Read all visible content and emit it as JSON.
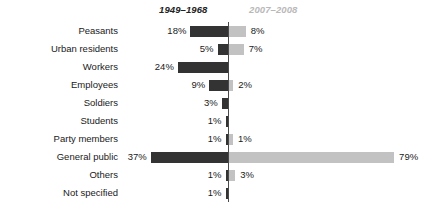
{
  "chart_data": {
    "type": "bar",
    "subtype": "diverging-horizontal-bar",
    "title": "",
    "subtitle": "",
    "xlabel": "",
    "ylabel": "",
    "grid": false,
    "legend_position": "top",
    "axis_zero_label": "0%",
    "value_suffix": "%",
    "xlim": [
      0,
      79
    ],
    "categories": [
      "Peasants",
      "Urban residents",
      "Workers",
      "Employees",
      "Soldiers",
      "Students",
      "Party members",
      "General public",
      "Others",
      "Not specified"
    ],
    "series": [
      {
        "name": "1949–1968",
        "side": "left",
        "color": "#333333",
        "values": [
          18,
          5,
          24,
          9,
          3,
          1,
          1,
          37,
          1,
          1
        ],
        "labels": [
          "18%",
          "5%",
          "24%",
          "9%",
          "3%",
          "1%",
          "1%",
          "37%",
          "1%",
          "1%"
        ]
      },
      {
        "name": "2007–2008",
        "side": "right",
        "color": "#c2c2c2",
        "values": [
          8,
          7,
          0,
          2,
          0,
          0,
          1,
          79,
          3,
          0
        ],
        "labels": [
          "8%",
          "7%",
          "",
          "2%",
          "",
          "",
          "1%",
          "79%",
          "3%",
          ""
        ]
      }
    ]
  },
  "legend": {
    "left_label": "1949–1968",
    "right_label": "2007–2008",
    "left_color": "#333333",
    "right_color": "#c2c2c2"
  },
  "colors": {
    "bar_left": "#333333",
    "bar_right": "#c2c2c2",
    "axis": "#4a4a4a",
    "text": "#1a1a1a",
    "legend_right_text": "#b9b9b9",
    "background": "#ffffff"
  }
}
